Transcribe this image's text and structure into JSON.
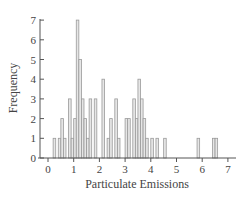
{
  "chart_data": {
    "type": "bar",
    "title": "",
    "xlabel": "Particulate Emissions",
    "ylabel": "Frequency",
    "xlim": [
      0,
      7
    ],
    "ylim": [
      0,
      7
    ],
    "x_ticks": [
      "0",
      "1",
      "2",
      "3",
      "4",
      "5",
      "6",
      "7"
    ],
    "y_ticks": [
      "0",
      "1",
      "2",
      "3",
      "4",
      "5",
      "6",
      "7"
    ],
    "grid": false,
    "legend": null,
    "bin_width": 0.1,
    "bins": [
      {
        "x": 0.2,
        "count": 1
      },
      {
        "x": 0.4,
        "count": 1
      },
      {
        "x": 0.5,
        "count": 2
      },
      {
        "x": 0.6,
        "count": 1
      },
      {
        "x": 0.8,
        "count": 3
      },
      {
        "x": 0.9,
        "count": 1
      },
      {
        "x": 1.0,
        "count": 2
      },
      {
        "x": 1.1,
        "count": 7
      },
      {
        "x": 1.2,
        "count": 5
      },
      {
        "x": 1.3,
        "count": 3
      },
      {
        "x": 1.4,
        "count": 2
      },
      {
        "x": 1.5,
        "count": 1
      },
      {
        "x": 1.6,
        "count": 3
      },
      {
        "x": 1.8,
        "count": 3
      },
      {
        "x": 2.1,
        "count": 4
      },
      {
        "x": 2.3,
        "count": 1
      },
      {
        "x": 2.4,
        "count": 2
      },
      {
        "x": 2.6,
        "count": 3
      },
      {
        "x": 2.7,
        "count": 1
      },
      {
        "x": 3.0,
        "count": 2
      },
      {
        "x": 3.1,
        "count": 2
      },
      {
        "x": 3.3,
        "count": 3
      },
      {
        "x": 3.4,
        "count": 2
      },
      {
        "x": 3.5,
        "count": 4
      },
      {
        "x": 3.6,
        "count": 3
      },
      {
        "x": 3.7,
        "count": 2
      },
      {
        "x": 3.8,
        "count": 1
      },
      {
        "x": 4.0,
        "count": 1
      },
      {
        "x": 4.2,
        "count": 1
      },
      {
        "x": 4.5,
        "count": 1
      },
      {
        "x": 5.8,
        "count": 1
      },
      {
        "x": 6.4,
        "count": 1
      },
      {
        "x": 6.5,
        "count": 1
      }
    ]
  }
}
